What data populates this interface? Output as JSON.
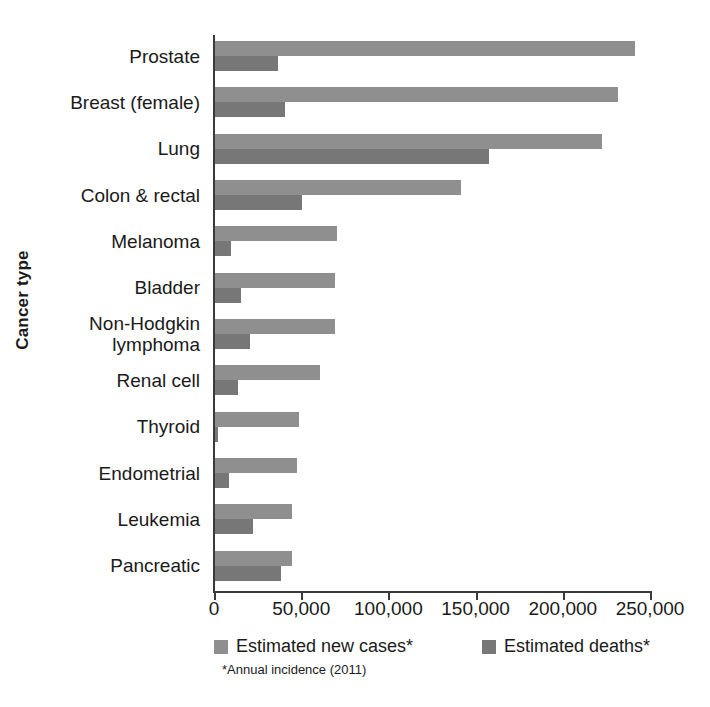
{
  "chart_data": {
    "type": "bar",
    "orientation": "horizontal",
    "title": "",
    "xlabel": "",
    "ylabel": "Cancer type",
    "xlim": [
      0,
      250000
    ],
    "xticks": [
      0,
      50000,
      100000,
      150000,
      200000,
      250000
    ],
    "xtick_labels": [
      "0",
      "50,000",
      "100,000",
      "150,000",
      "200,000",
      "250,000"
    ],
    "grid": false,
    "legend_position": "bottom",
    "footnote": "*Annual incidence (2011)",
    "categories": [
      "Prostate",
      "Breast (female)",
      "Lung",
      "Colon & rectal",
      "Melanoma",
      "Bladder",
      "Non-Hodgkin\nlymphoma",
      "Renal cell",
      "Thyroid",
      "Endometrial",
      "Leukemia",
      "Pancreatic"
    ],
    "series": [
      {
        "name": "Estimated new cases*",
        "color": "#8f8f8f",
        "values": [
          241000,
          231000,
          222000,
          141000,
          70000,
          69000,
          69000,
          60000,
          48000,
          47000,
          44000,
          44000
        ]
      },
      {
        "name": "Estimated deaths*",
        "color": "#777777",
        "values": [
          36000,
          40000,
          157000,
          50000,
          9000,
          15000,
          20000,
          13000,
          1700,
          8000,
          22000,
          38000
        ]
      }
    ]
  },
  "axis": {
    "y_title": "Cancer type"
  },
  "legend": {
    "items": [
      {
        "label": "Estimated new cases*",
        "color": "#8f8f8f"
      },
      {
        "label": "Estimated deaths*",
        "color": "#777777"
      }
    ]
  },
  "footnote": {
    "text": "*Annual incidence (2011)"
  }
}
